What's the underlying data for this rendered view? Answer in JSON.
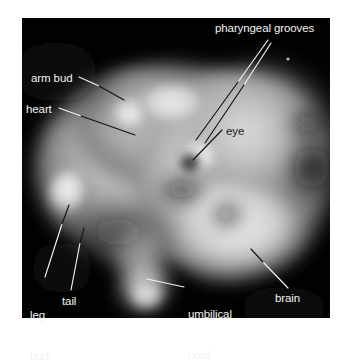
{
  "figure": {
    "kind": "labeled-anatomical-photograph",
    "plate_background": "#010101",
    "page_background": "#ffffff",
    "label_color_light": "#f2f2f2",
    "label_color_dark": "#1a1a1a"
  },
  "labels": [
    {
      "id": "pharyngeal-grooves",
      "text": "pharyngeal grooves",
      "tone": "light",
      "x": 215,
      "y": 22,
      "lines": 1
    },
    {
      "id": "arm-bud",
      "text": "arm bud",
      "tone": "light",
      "x": 31,
      "y": 72,
      "lines": 1
    },
    {
      "id": "heart",
      "text": "heart",
      "tone": "light",
      "x": 26,
      "y": 103,
      "lines": 1
    },
    {
      "id": "eye",
      "text": "eye",
      "tone": "dark",
      "x": 226,
      "y": 125,
      "lines": 1
    },
    {
      "id": "leg-bud",
      "text": "leg\nbud",
      "text_line_1": "leg",
      "text_line_2": "bud",
      "tone": "light",
      "x": 30,
      "y": 282,
      "lines": 2
    },
    {
      "id": "tail",
      "text": "tail",
      "tone": "light",
      "x": 62,
      "y": 295,
      "lines": 1
    },
    {
      "id": "umbilical-cord",
      "text": "umbilical\ncord",
      "text_line_1": "umbilical",
      "text_line_2": "cord",
      "tone": "light",
      "x": 188,
      "y": 281,
      "lines": 2
    },
    {
      "id": "brain",
      "text": "brain",
      "tone": "light",
      "x": 275,
      "y": 292,
      "lines": 1
    }
  ],
  "leader_lines": [
    {
      "id": "pharyngeal-grooves-leader-outer",
      "from": [
        268,
        40
      ],
      "to": [
        196,
        140
      ],
      "segments": [
        {
          "x1": 268,
          "y1": 40,
          "x2": 238,
          "y2": 82,
          "color": "#f2f2f2"
        },
        {
          "x1": 238,
          "y1": 82,
          "x2": 196,
          "y2": 140,
          "color": "#141414"
        }
      ]
    },
    {
      "id": "pharyngeal-grooves-leader-inner",
      "from": [
        270,
        42
      ],
      "to": [
        204,
        142
      ],
      "segments": [
        {
          "x1": 270,
          "y1": 42,
          "x2": 243,
          "y2": 84,
          "color": "#f2f2f2"
        },
        {
          "x1": 243,
          "y1": 84,
          "x2": 204,
          "y2": 142,
          "color": "#141414"
        }
      ]
    },
    {
      "id": "arm-bud-leader",
      "from": [
        79,
        77
      ],
      "to": [
        124,
        100
      ],
      "segments": [
        {
          "x1": 79,
          "y1": 77,
          "x2": 98,
          "y2": 86,
          "color": "#f2f2f2"
        },
        {
          "x1": 98,
          "y1": 86,
          "x2": 124,
          "y2": 100,
          "color": "#141414"
        }
      ]
    },
    {
      "id": "heart-leader",
      "from": [
        59,
        108
      ],
      "to": [
        134,
        134
      ],
      "segments": [
        {
          "x1": 59,
          "y1": 108,
          "x2": 80,
          "y2": 116,
          "color": "#f2f2f2"
        },
        {
          "x1": 80,
          "y1": 116,
          "x2": 134,
          "y2": 134,
          "color": "#141414"
        }
      ]
    },
    {
      "id": "eye-leader",
      "from": [
        222,
        130
      ],
      "to": [
        192,
        160
      ],
      "segments": [
        {
          "x1": 222,
          "y1": 130,
          "x2": 192,
          "y2": 160,
          "color": "#141414"
        }
      ]
    },
    {
      "id": "leg-bud-leader",
      "from": [
        45,
        277
      ],
      "to": [
        68,
        206
      ],
      "segments": [
        {
          "x1": 45,
          "y1": 277,
          "x2": 62,
          "y2": 224,
          "color": "#f2f2f2"
        },
        {
          "x1": 62,
          "y1": 224,
          "x2": 68,
          "y2": 206,
          "color": "#141414"
        }
      ]
    },
    {
      "id": "tail-leader",
      "from": [
        71,
        290
      ],
      "to": [
        83,
        229
      ],
      "segments": [
        {
          "x1": 71,
          "y1": 290,
          "x2": 80,
          "y2": 243,
          "color": "#f2f2f2"
        },
        {
          "x1": 80,
          "y1": 243,
          "x2": 83,
          "y2": 229,
          "color": "#141414"
        }
      ]
    },
    {
      "id": "umbilical-cord-leader",
      "from": [
        184,
        287
      ],
      "to": [
        147,
        279
      ],
      "segments": [
        {
          "x1": 184,
          "y1": 287,
          "x2": 147,
          "y2": 279,
          "color": "#f2f2f2"
        }
      ]
    },
    {
      "id": "brain-leader",
      "from": [
        288,
        288
      ],
      "to": [
        252,
        250
      ],
      "segments": [
        {
          "x1": 288,
          "y1": 288,
          "x2": 263,
          "y2": 262,
          "color": "#f2f2f2"
        },
        {
          "x1": 263,
          "y1": 262,
          "x2": 252,
          "y2": 250,
          "color": "#141414"
        }
      ]
    }
  ],
  "photo_shapes": {
    "description": "grayscale embryo blobs composing the lateral embryo silhouette",
    "speck_top_right": {
      "x": 288,
      "y": 59,
      "r": 1.6,
      "color": "#b8b8b8"
    },
    "eye_spot": {
      "cx": 190,
      "cy": 163,
      "rx": 8,
      "ry": 7.5,
      "color": "#3a3a3a"
    }
  }
}
